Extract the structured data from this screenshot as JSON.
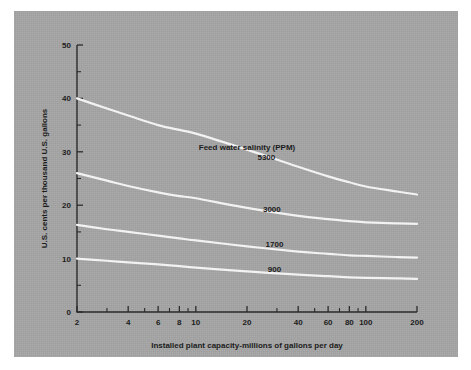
{
  "figure": {
    "panel_color": "#a6a6a6",
    "background_color": "#ffffff",
    "curve_color": "#f2f2f2",
    "axis_color": "#2b2b2b"
  },
  "chart_data": {
    "type": "line",
    "title": "",
    "xlabel": "Installed plant capacity-millions of gallons per day",
    "ylabel": "U.S. cents per thousand U.S. gallons",
    "xscale": "log",
    "yscale": "linear",
    "xlim": [
      2,
      200
    ],
    "ylim": [
      0,
      50
    ],
    "grid": false,
    "legend_position": "inline-right-of-curves",
    "legend_title": "Feed water salinity (PPM)",
    "x_ticks": [
      2,
      4,
      6,
      8,
      10,
      20,
      40,
      60,
      80,
      100,
      200
    ],
    "x_tick_labels": [
      "2",
      "4",
      "6",
      "8",
      "10",
      "20",
      "40",
      "60",
      "80",
      "100",
      "200"
    ],
    "x_minor_ticks": [
      3,
      5,
      7,
      9,
      30,
      50,
      70,
      90
    ],
    "y_ticks": [
      0,
      10,
      20,
      30,
      40,
      50
    ],
    "y_tick_labels": [
      "0",
      "10",
      "20",
      "30",
      "40",
      "50"
    ],
    "y_minor_ticks": [
      5,
      15,
      25,
      35,
      45
    ],
    "x": [
      2,
      3,
      4,
      6,
      8,
      10,
      20,
      40,
      60,
      80,
      100,
      150,
      200
    ],
    "series": [
      {
        "name": "5300",
        "label": "5300",
        "values": [
          40.0,
          38.1,
          36.8,
          35.0,
          34.1,
          33.4,
          30.4,
          27.2,
          25.4,
          24.3,
          23.5,
          22.6,
          22.0
        ]
      },
      {
        "name": "3000",
        "label": "3000",
        "values": [
          26.0,
          24.6,
          23.6,
          22.4,
          21.7,
          21.3,
          19.5,
          18.0,
          17.4,
          17.0,
          16.8,
          16.6,
          16.5
        ]
      },
      {
        "name": "1700",
        "label": "1700",
        "values": [
          16.3,
          15.5,
          15.0,
          14.3,
          13.8,
          13.4,
          12.3,
          11.3,
          10.9,
          10.6,
          10.5,
          10.3,
          10.2
        ]
      },
      {
        "name": "900",
        "label": "900",
        "values": [
          10.0,
          9.6,
          9.3,
          8.9,
          8.6,
          8.3,
          7.6,
          7.0,
          6.7,
          6.5,
          6.4,
          6.3,
          6.2
        ]
      }
    ],
    "series_label_positions": [
      {
        "label": "5300",
        "x": 26,
        "y": 28.5
      },
      {
        "label": "3000",
        "x": 28,
        "y": 18.7
      },
      {
        "label": "1700",
        "x": 29,
        "y": 12.1
      },
      {
        "label": "900",
        "x": 29,
        "y": 7.5
      }
    ],
    "legend_title_position": {
      "x": 20,
      "y": 30.3
    }
  }
}
